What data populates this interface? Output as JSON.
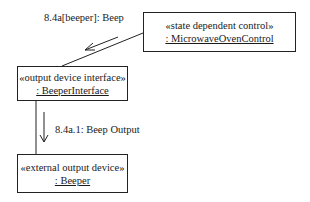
{
  "diagram": {
    "type": "UML communication diagram",
    "objects": [
      {
        "id": "control",
        "stereotype": "«state dependent control»",
        "name": ": MicrowaveOvenControl"
      },
      {
        "id": "interface",
        "stereotype": "«output device interface»",
        "name": ": BeeperInterface"
      },
      {
        "id": "device",
        "stereotype": "«external output device»",
        "name": ": Beeper"
      }
    ],
    "messages": [
      {
        "id": "m1",
        "label": "8.4a[beeper]: Beep",
        "from": "control",
        "to": "interface"
      },
      {
        "id": "m2",
        "label": "8.4a.1: Beep Output",
        "from": "interface",
        "to": "device"
      }
    ],
    "colors": {
      "line": "#222222",
      "background": "#ffffff"
    }
  }
}
